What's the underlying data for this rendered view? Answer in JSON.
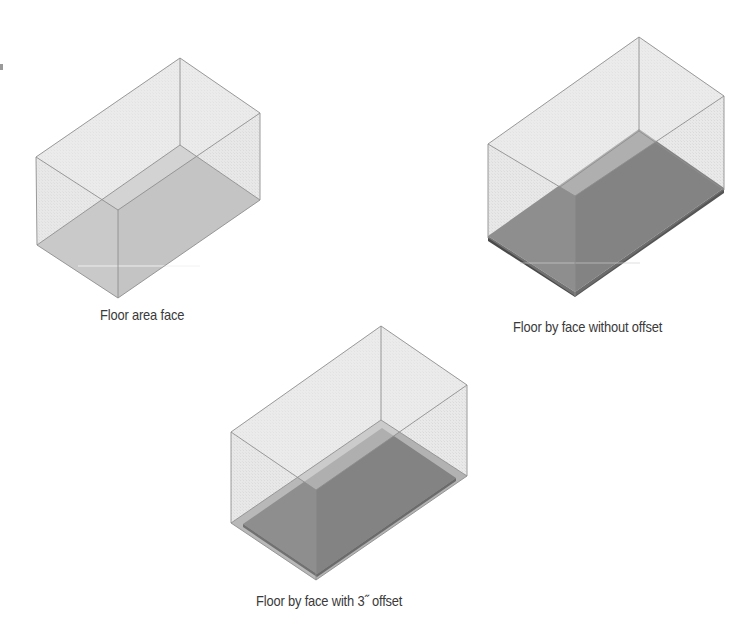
{
  "figures": [
    {
      "id": "floor-area-face",
      "caption": "Floor area face",
      "floor_style": "area-face",
      "caption_pos": [
        100,
        306
      ]
    },
    {
      "id": "floor-by-face-without-offset",
      "caption": "Floor by face without offset",
      "floor_style": "slab-no-offset",
      "caption_pos": [
        513,
        318
      ]
    },
    {
      "id": "floor-by-face-with-offset",
      "caption": "Floor by face with 3˝ offset",
      "floor_style": "slab-with-offset",
      "caption_pos": [
        256,
        592
      ]
    }
  ],
  "colors": {
    "wall_fill": "#e4e4e4",
    "edge_stroke": "#8f8f8f",
    "area_face": "#b9b9b9",
    "slab_fill": "#717171",
    "slab_edge": "#4a4a4a",
    "offset_band": "#a9a9a9",
    "caption_text": "#3a3a3a"
  }
}
